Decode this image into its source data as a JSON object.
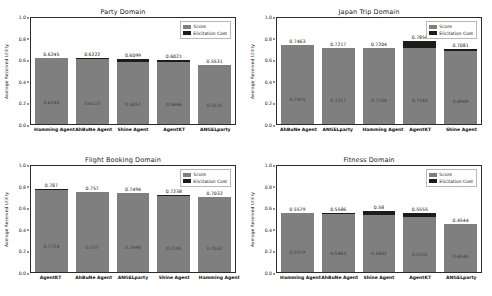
{
  "figure": {
    "ylabel": "Average Received Utility",
    "yticks": [
      "0.0",
      "0.2",
      "0.4",
      "0.6",
      "0.8",
      "1.0"
    ],
    "legend": {
      "score_label": "Score",
      "cost_label": "Elicitation Cost",
      "score_color": "#7f7f7f",
      "cost_color": "#1c1c1c"
    }
  },
  "chart_data": [
    {
      "type": "bar",
      "title": "Party Domain",
      "xlabel": "",
      "ylabel": "Average Received Utility",
      "ylim": [
        0.0,
        1.0
      ],
      "grid": false,
      "legend_position": "upper right",
      "categories": [
        "Hamming Agent",
        "AhBuNe Agent",
        "Shine Agent",
        "AgentKT",
        "ANGELparty"
      ],
      "series": [
        {
          "name": "Score",
          "values": [
            0.6245,
            0.6123,
            0.5857,
            0.5846,
            0.5531
          ]
        },
        {
          "name": "Elicitation Cost",
          "values": [
            0.0,
            0.0099,
            0.0242,
            0.0175,
            0.0
          ]
        }
      ],
      "totals": [
        0.6245,
        0.6222,
        0.6099,
        0.6021,
        0.5531
      ],
      "top_labels": [
        "0.6245",
        "0.6222",
        "0.6099",
        "0.6021",
        "0.5531"
      ],
      "inner_labels": [
        "0.6245",
        "0.6123",
        "0.5857",
        "0.5846",
        "0.5531"
      ]
    },
    {
      "type": "bar",
      "title": "Japan Trip Domain",
      "xlabel": "",
      "ylabel": "Average Received Utility",
      "ylim": [
        0.0,
        1.0
      ],
      "grid": false,
      "legend_position": "upper right",
      "categories": [
        "AhBuNe Agent",
        "ANGELparty",
        "Hamming Agent",
        "AgentKT",
        "Shine Agent"
      ],
      "series": [
        {
          "name": "Score",
          "values": [
            0.7425,
            0.7217,
            0.7204,
            0.7183,
            0.6909
          ]
        },
        {
          "name": "Elicitation Cost",
          "values": [
            0.0038,
            0.0,
            0.0,
            0.0673,
            0.0172
          ]
        }
      ],
      "totals": [
        0.7463,
        0.7217,
        0.7204,
        0.7856,
        0.7081
      ],
      "top_labels": [
        "0.7463",
        "0.7217",
        "0.7204",
        "0.7856",
        "0.7081"
      ],
      "inner_labels": [
        "0.7425",
        "0.7217",
        "0.7204",
        "0.7183",
        "0.6909"
      ]
    },
    {
      "type": "bar",
      "title": "Flight Booking Domain",
      "xlabel": "",
      "ylabel": "Average Received Utility",
      "ylim": [
        0.0,
        1.0
      ],
      "grid": false,
      "legend_position": "upper right",
      "categories": [
        "AgentKT",
        "AhBuNe Agent",
        "ANGELparty",
        "Shine Agent",
        "Hamming Agent"
      ],
      "series": [
        {
          "name": "Score",
          "values": [
            0.7714,
            0.757,
            0.7494,
            0.7185,
            0.7032
          ]
        },
        {
          "name": "Elicitation Cost",
          "values": [
            0.0156,
            0.0,
            0.0,
            0.0053,
            0.0
          ]
        }
      ],
      "totals": [
        0.787,
        0.757,
        0.7494,
        0.7238,
        0.7032
      ],
      "top_labels": [
        "0.787",
        "0.757",
        "0.7494",
        "0.7238",
        "0.7032"
      ],
      "inner_labels": [
        "0.7714",
        "0.757",
        "0.7494",
        "0.7185",
        "0.7032"
      ]
    },
    {
      "type": "bar",
      "title": "Fitness Domain",
      "xlabel": "",
      "ylabel": "Average Received Utility",
      "ylim": [
        0.0,
        1.0
      ],
      "grid": false,
      "legend_position": "upper right",
      "categories": [
        "Hamming Agent",
        "AhBuNe Agent",
        "Shine Agent",
        "AgentKT",
        "ANGELparty"
      ],
      "series": [
        {
          "name": "Score",
          "values": [
            0.5579,
            0.5483,
            0.5401,
            0.5201,
            0.4544
          ]
        },
        {
          "name": "Elicitation Cost",
          "values": [
            0.0,
            0.0103,
            0.0399,
            0.0354,
            0.0
          ]
        }
      ],
      "totals": [
        0.5579,
        0.5586,
        0.58,
        0.5555,
        0.4544
      ],
      "top_labels": [
        "0.5579",
        "0.5586",
        "0.58",
        "0.5555",
        "0.4544"
      ],
      "inner_labels": [
        "0.5579",
        "0.5483",
        "0.5401",
        "0.5201",
        "0.4544"
      ]
    }
  ]
}
